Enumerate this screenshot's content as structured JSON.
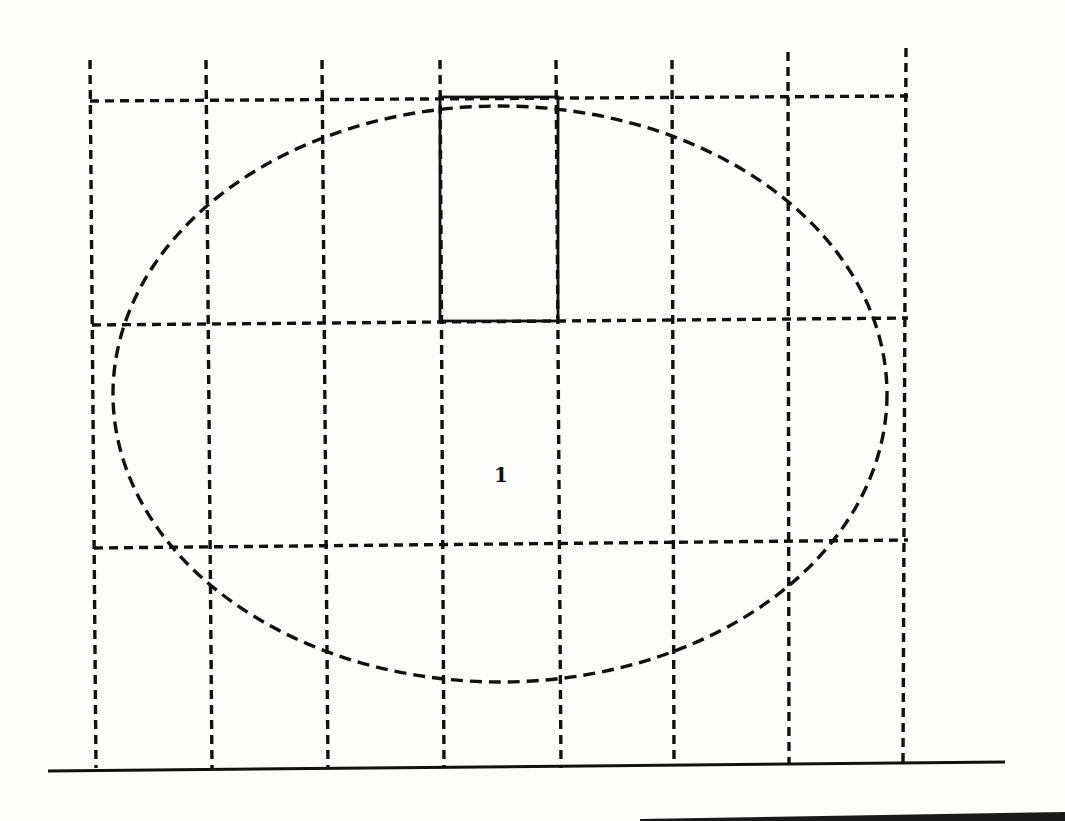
{
  "figure": {
    "type": "grid-over-ellipse diagram",
    "region_label": "1",
    "colors": {
      "ink": "#111111",
      "paper": "#fdfdfb"
    },
    "grid": {
      "columns": 7,
      "rows": 3,
      "vertical_lines_top_x": [
        90,
        206,
        322,
        440,
        556,
        672,
        788,
        906
      ],
      "vertical_lines_bottom_x": [
        96,
        212,
        328,
        444,
        561,
        674,
        789,
        903
      ],
      "vertical_top_y": 60,
      "vertical_bottom_y": 768,
      "horizontal_lines": [
        {
          "y_left": 101,
          "y_right": 96
        },
        {
          "y_left": 325,
          "y_right": 318
        },
        {
          "y_left": 548,
          "y_right": 540
        }
      ],
      "horizontal_x_start": 90,
      "horizontal_x_end": 908,
      "style": "dashed"
    },
    "ellipse": {
      "cx": 500,
      "cy": 394,
      "rx": 387,
      "ry": 288,
      "style": "dashed"
    },
    "highlighted_cell": {
      "x1": 440,
      "y1": 97,
      "x2": 558,
      "y2": 321,
      "style": "solid"
    },
    "label_position": {
      "x": 500,
      "y": 482
    },
    "ground_line": {
      "x1": 48,
      "y1": 771,
      "x2": 1005,
      "y2": 762
    }
  }
}
